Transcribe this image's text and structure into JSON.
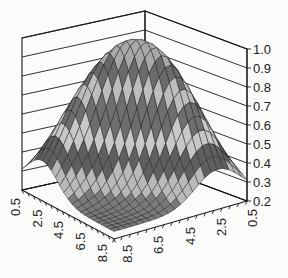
{
  "chart_data": {
    "type": "surface3d",
    "title": "",
    "xlabel": "",
    "ylabel": "",
    "zlabel": "",
    "z_axis": {
      "ticks": [
        "0.2",
        "0.3",
        "0.4",
        "0.5",
        "0.6",
        "0.7",
        "0.8",
        "0.9",
        "1.0"
      ],
      "range": [
        0.2,
        1.0
      ]
    },
    "left_axis": {
      "ticks": [
        "0.5",
        "2.5",
        "4.5",
        "6.5",
        "8.5"
      ],
      "range": [
        0.5,
        8.5
      ]
    },
    "right_axis": {
      "ticks": [
        "8.5",
        "6.5",
        "4.5",
        "2.5",
        "0.5"
      ],
      "range": [
        0.5,
        8.5
      ]
    },
    "grid": true,
    "legend": null,
    "surface_description": "Arch-shaped ridge surface peaking near 1.0 along a diagonal, falling to about 0.25-0.3 at the front corners; band shading alternates light/dark gray every 0.1 in z.",
    "band_colors": [
      "#7a7a7a",
      "#b9b9b9",
      "#5f5f5f",
      "#c8c8c8",
      "#6e6e6e",
      "#bdbdbd",
      "#6a6a6a",
      "#a8a8a8",
      "#888888"
    ]
  }
}
